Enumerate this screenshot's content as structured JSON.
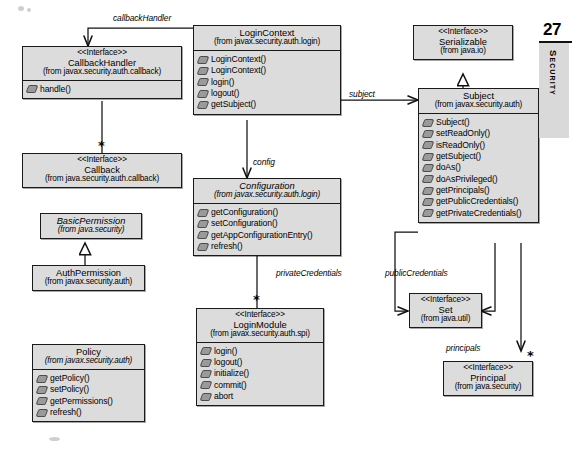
{
  "diagram": {
    "type": "uml-class-diagram",
    "page_marker": {
      "number": "27",
      "tab_label": "Security"
    }
  },
  "classes": [
    {
      "id": "callbackhandler",
      "stereotype": "<<Interface>>",
      "name": "CallbackHandler",
      "package": "(from javax.security.auth.callback)",
      "abstract": false,
      "operations": [
        "handle()"
      ]
    },
    {
      "id": "callback",
      "stereotype": "<<Interface>>",
      "name": "Callback",
      "package": "(from java.security.auth.callback)",
      "abstract": false,
      "operations": []
    },
    {
      "id": "basicpermission",
      "stereotype": "",
      "name": "BasicPermission",
      "package": "(from java.security)",
      "abstract": true,
      "operations": []
    },
    {
      "id": "authpermission",
      "stereotype": "",
      "name": "AuthPermission",
      "package": "(from javax.security.auth)",
      "abstract": false,
      "operations": []
    },
    {
      "id": "policy",
      "stereotype": "",
      "name": "Policy",
      "package": "(from javax.security.auth)",
      "abstract": true,
      "operations": [
        "getPolicy()",
        "setPolicy()",
        "getPermissions()",
        "refresh()"
      ]
    },
    {
      "id": "logincontext",
      "stereotype": "",
      "name": "LoginContext",
      "package": "(from javax.security.auth.login)",
      "abstract": false,
      "operations": [
        "LoginContext()",
        "LoginContext()",
        "login()",
        "logout()",
        "getSubject()"
      ]
    },
    {
      "id": "configuration",
      "stereotype": "",
      "name": "Configuration",
      "package": "(from javax.security.auth.login)",
      "abstract": true,
      "operations": [
        "getConfiguration()",
        "setConfiguration()",
        "getAppConfigurationEntry()",
        "refresh()"
      ]
    },
    {
      "id": "loginmodule",
      "stereotype": "<<Interface>>",
      "name": "LoginModule",
      "package": "(from javax.security.auth.spi)",
      "abstract": false,
      "operations": [
        "login()",
        "logout()",
        "initialize()",
        "commit()",
        "abort"
      ]
    },
    {
      "id": "serializable",
      "stereotype": "<<Interface>>",
      "name": "Serializable",
      "package": "(from java.io)",
      "abstract": false,
      "operations": []
    },
    {
      "id": "subject",
      "stereotype": "",
      "name": "Subject",
      "package": "(from javax.security.auth)",
      "abstract": false,
      "operations": [
        "Subject()",
        "setReadOnly()",
        "isReadOnly()",
        "getSubject()",
        "doAs()",
        "doAsPrivileged()",
        "getPrincipals()",
        "getPublicCredentials()",
        "getPrivateCredentials()"
      ]
    },
    {
      "id": "set",
      "stereotype": "<<Interface>>",
      "name": "Set",
      "package": "(from java.util)",
      "abstract": false,
      "operations": []
    },
    {
      "id": "principal",
      "stereotype": "<<Interface>>",
      "name": "Principal",
      "package": "(from java.security)",
      "abstract": false,
      "operations": []
    }
  ],
  "relationships": [
    {
      "id": "rel-callbackhandler",
      "label": "callbackHandler",
      "multiplicity": "",
      "from": "logincontext",
      "to": "callbackhandler",
      "kind": "association"
    },
    {
      "id": "rel-callback",
      "label": "",
      "multiplicity": "*",
      "from": "callbackhandler",
      "to": "callback",
      "kind": "association"
    },
    {
      "id": "rel-authpermission",
      "label": "",
      "multiplicity": "",
      "from": "authpermission",
      "to": "basicpermission",
      "kind": "generalization"
    },
    {
      "id": "rel-config",
      "label": "config",
      "multiplicity": "",
      "from": "logincontext",
      "to": "configuration",
      "kind": "association"
    },
    {
      "id": "rel-loginmodule",
      "label": "",
      "multiplicity": "*",
      "from": "configuration",
      "to": "loginmodule",
      "kind": "association"
    },
    {
      "id": "rel-subject",
      "label": "subject",
      "multiplicity": "",
      "from": "logincontext",
      "to": "subject",
      "kind": "association"
    },
    {
      "id": "rel-serializable",
      "label": "",
      "multiplicity": "",
      "from": "subject",
      "to": "serializable",
      "kind": "realization"
    },
    {
      "id": "rel-privatecredentials",
      "label": "privateCredentials",
      "multiplicity": "",
      "from": "subject",
      "to": "set",
      "kind": "association"
    },
    {
      "id": "rel-publiccredentials",
      "label": "publicCredentials",
      "multiplicity": "",
      "from": "subject",
      "to": "set",
      "kind": "association"
    },
    {
      "id": "rel-principals",
      "label": "principals",
      "multiplicity": "*",
      "from": "subject",
      "to": "principal",
      "kind": "association"
    }
  ]
}
